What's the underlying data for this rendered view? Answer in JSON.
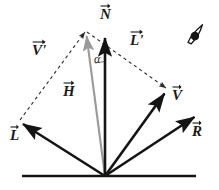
{
  "figure": {
    "background_color": "#ffffff",
    "stroke_color": "#141414",
    "halfway_vector_color": "#9a9a9a",
    "dashed_color": "#2b2b2b"
  },
  "labels": {
    "normal": "N",
    "halfway": "H",
    "light": "L",
    "light_prime": "L'",
    "view": "V",
    "view_prime": "V'",
    "reflection": "R",
    "angle_alpha": "α"
  },
  "icons": {
    "eye": "eye-icon"
  },
  "geometry": {
    "origin": {
      "x": 105,
      "y": 176
    },
    "surface_line": {
      "x1": 22,
      "y1": 176,
      "x2": 196,
      "y2": 176
    },
    "vectors": [
      {
        "name": "N",
        "label": "N",
        "tip_x": 105,
        "tip_y": 33,
        "style": "solid",
        "color": "#141414"
      },
      {
        "name": "H",
        "label": "H",
        "tip_x": 86,
        "tip_y": 31,
        "style": "solid",
        "color": "#9a9a9a"
      },
      {
        "name": "L",
        "label": "L",
        "tip_x": 19,
        "tip_y": 121,
        "style": "solid",
        "color": "#141414"
      },
      {
        "name": "V",
        "label": "V",
        "tip_x": 168,
        "tip_y": 89,
        "style": "solid",
        "color": "#141414"
      },
      {
        "name": "R",
        "label": "R",
        "tip_x": 198,
        "tip_y": 113,
        "style": "solid",
        "color": "#141414"
      }
    ],
    "dashed_edges": [
      {
        "name": "V-prime",
        "label": "V'",
        "x1": 19,
        "y1": 121,
        "x2": 86,
        "y2": 31
      },
      {
        "name": "L-prime",
        "label": "L'",
        "x1": 86,
        "y1": 31,
        "x2": 168,
        "y2": 89
      }
    ],
    "angle_arc": {
      "center_x": 105,
      "center_y": 176,
      "radius": 120,
      "between": [
        "H",
        "N"
      ]
    }
  },
  "label_positions": {
    "normal": {
      "x": 100,
      "y": 7
    },
    "halfway": {
      "x": 63,
      "y": 84
    },
    "light": {
      "x": 10,
      "y": 128
    },
    "light_prime": {
      "x": 130,
      "y": 33
    },
    "view": {
      "x": 172,
      "y": 88
    },
    "view_prime": {
      "x": 32,
      "y": 43
    },
    "reflection": {
      "x": 192,
      "y": 124
    },
    "angle_alpha": {
      "x": 94,
      "y": 54
    },
    "eye_icon": {
      "x": 185,
      "y": 35
    }
  }
}
